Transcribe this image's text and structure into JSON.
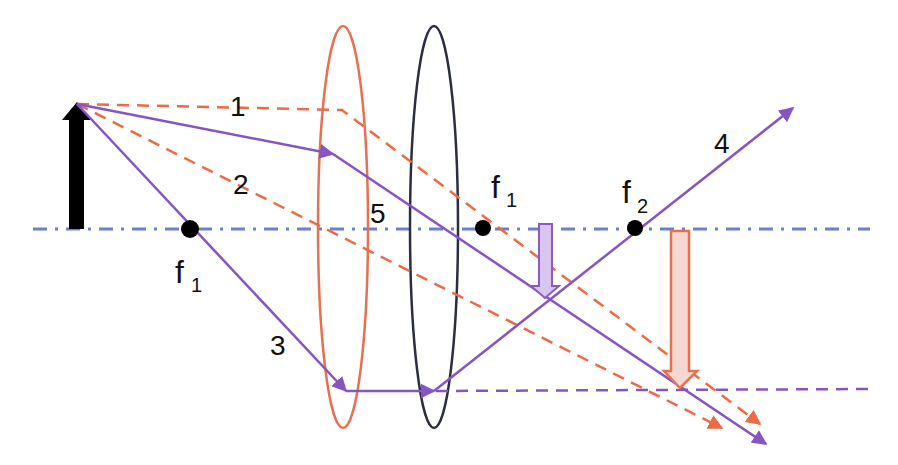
{
  "diagram": {
    "type": "optics-ray-diagram",
    "colors": {
      "axis": "#6b7fd4",
      "lens1": "#e8704f",
      "lens2": "#2b2d42",
      "orange_ray": "#ee6a45",
      "purple_ray": "#8654c4",
      "object": "#000000",
      "intermediate_image_fill": "#d9c6ee",
      "intermediate_image_stroke": "#8a5bc6",
      "final_image_fill": "#f6d8d2",
      "final_image_stroke": "#e8704f",
      "focal_point": "#000000"
    },
    "ray_labels": [
      {
        "id": "ray-1",
        "text": "1"
      },
      {
        "id": "ray-2",
        "text": "2"
      },
      {
        "id": "ray-3",
        "text": "3"
      },
      {
        "id": "ray-4",
        "text": "4"
      },
      {
        "id": "ray-5",
        "text": "5"
      }
    ],
    "focal_labels": [
      {
        "id": "f1-left",
        "base": "f",
        "sub": "1"
      },
      {
        "id": "f1-right",
        "base": "f",
        "sub": "1"
      },
      {
        "id": "f2",
        "base": "f",
        "sub": "2"
      }
    ]
  }
}
